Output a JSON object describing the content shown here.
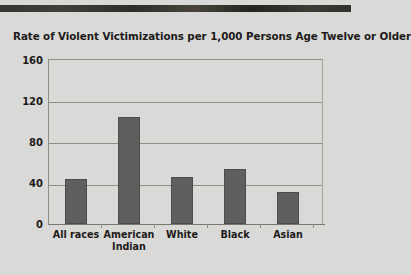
{
  "chart_data": {
    "type": "bar",
    "title": "Rate of Violent Victimizations per 1,000 Persons Age Twelve or Older",
    "xlabel": "",
    "ylabel": "",
    "categories": [
      "All races",
      "American Indian",
      "White",
      "Black",
      "Asian"
    ],
    "values": [
      44,
      104,
      46,
      53,
      31
    ],
    "ylim": [
      0,
      160
    ],
    "yticks": [
      0,
      40,
      80,
      120,
      160
    ],
    "ytick_labels": [
      "0",
      "40",
      "80",
      "120",
      "160"
    ],
    "grid": true,
    "legend": null,
    "bar_color": "#5f5f5d",
    "background_color": "#d9d9d7",
    "gridline_color": "#8d8d8a"
  },
  "category_lines": [
    [
      "All races",
      ""
    ],
    [
      "American",
      "Indian"
    ],
    [
      "White",
      ""
    ],
    [
      "Black",
      ""
    ],
    [
      "Asian",
      ""
    ]
  ],
  "caption": ""
}
